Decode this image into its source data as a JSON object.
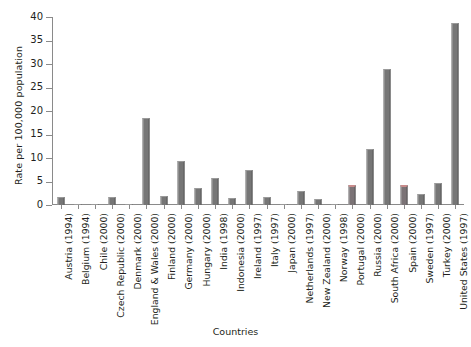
{
  "chart_data": {
    "type": "bar",
    "title": "",
    "xlabel": "Countries",
    "ylabel": "Rate per 100,000 population",
    "ylim": [
      0,
      40
    ],
    "yticks": [
      0,
      5,
      10,
      15,
      20,
      25,
      30,
      35,
      40
    ],
    "grid": false,
    "legend": "none",
    "bar_color": "#767676",
    "highlight_color": "#c98b8b",
    "categories": [
      "Austria (1994)",
      "Belgium (1994)",
      "Chile (2000)",
      "Czech Republic (2000)",
      "Denmark (2000)",
      "England & Wales (2000)",
      "Finland (2000)",
      "Germany (2000)",
      "Hungary (2000)",
      "India (1998)",
      "Indonesia (2000)",
      "Ireland (1997)",
      "Italy (1997)",
      "Japan (2000)",
      "Netherlands (1997)",
      "New Zealand (2000)",
      "Norway (1998)",
      "Portugal (2000)",
      "Russia (2000)",
      "South Africa (2000)",
      "Spain (2000)",
      "Sweden (1997)",
      "Turkey (2000)",
      "United States (1997)"
    ],
    "values": [
      1.6,
      0.2,
      0.2,
      1.7,
      0.3,
      18.5,
      1.9,
      9.4,
      3.7,
      5.7,
      1.4,
      7.4,
      1.6,
      0.2,
      2.9,
      1.2,
      0.3,
      4.3,
      12.0,
      29.0,
      4.2,
      2.4,
      4.6,
      38.8
    ],
    "highlighted": [
      17,
      20
    ]
  },
  "axis": {
    "y_title": "Rate per 100,000 population",
    "x_title": "Countries"
  }
}
